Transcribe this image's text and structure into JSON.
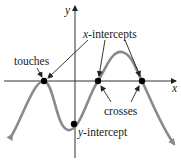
{
  "figure": {
    "axes": {
      "x_label": "x",
      "y_label": "y"
    },
    "annotations": {
      "touches": "touches",
      "x_intercepts_italic": "x",
      "x_intercepts_rest": "-intercepts",
      "crosses": "crosses",
      "y_intercept_italic": "y",
      "y_intercept_rest": "-intercept"
    },
    "colors": {
      "curve": "#8a8a8a",
      "axes": "#333333",
      "points": "#000000",
      "arrows": "#222222"
    },
    "points": [
      {
        "name": "touch-point",
        "x": 44,
        "y": 81,
        "type": "touches"
      },
      {
        "name": "cross-point-1",
        "x": 98,
        "y": 81,
        "type": "crosses"
      },
      {
        "name": "cross-point-2",
        "x": 142,
        "y": 81,
        "type": "crosses"
      },
      {
        "name": "y-intercept-point",
        "x": 74,
        "y": 124,
        "type": "y-intercept"
      }
    ]
  }
}
